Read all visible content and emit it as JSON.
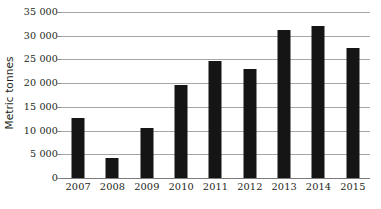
{
  "chart_data": {
    "type": "bar",
    "title": "",
    "subtitle": "",
    "xlabel": "",
    "ylabel": "Metric tonnes",
    "categories": [
      "2007",
      "2008",
      "2009",
      "2010",
      "2011",
      "2012",
      "2013",
      "2014",
      "2015"
    ],
    "values": [
      12600,
      4200,
      10600,
      19600,
      24600,
      23000,
      31200,
      32000,
      27500
    ],
    "series": [
      {
        "name": "Metric tonnes",
        "values": [
          12600,
          4200,
          10600,
          19600,
          24600,
          23000,
          31200,
          32000,
          27500
        ]
      }
    ],
    "ylim": [
      0,
      35000
    ],
    "y_ticks": [
      0,
      5000,
      10000,
      15000,
      20000,
      25000,
      30000,
      35000
    ],
    "y_tick_labels": [
      "0",
      "5 000",
      "10 000",
      "15 000",
      "20 000",
      "25 000",
      "30 000",
      "35 000"
    ],
    "x_tick_labels": [
      "2007",
      "2008",
      "2009",
      "2010",
      "2011",
      "2012",
      "2013",
      "2014",
      "2015"
    ],
    "grid": true,
    "grid_axis": "y",
    "legend": false,
    "legend_position": "none",
    "annotations": [],
    "colors": {
      "bar": "#151515",
      "gridline": "#a6a6a6",
      "axis": "#7a7a7a",
      "text": "#231f20",
      "background": "#ffffff"
    }
  }
}
